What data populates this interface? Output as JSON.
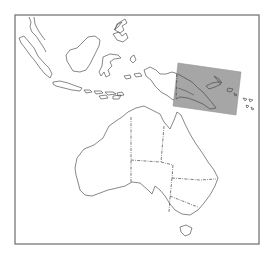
{
  "figure": {
    "type": "locator-map",
    "region": "Australia, Indonesia and Melanesia",
    "frame": {
      "x": 15,
      "y": 15,
      "width": 244,
      "height": 229,
      "stroke": "#777777"
    },
    "highlight": {
      "label": "",
      "area": "Papua New Guinea / Solomon Islands",
      "fill": "#9a9a9a",
      "opacity": 0.9,
      "corners": [
        [
          178,
          63
        ],
        [
          241,
          72
        ],
        [
          236,
          115
        ],
        [
          173,
          106
        ]
      ]
    },
    "colors": {
      "background": "#ffffff",
      "coastline": "#555555",
      "state_border": "#444444"
    },
    "features": [
      "sumatra",
      "java",
      "lesser-sunda-islands",
      "borneo",
      "sulawesi",
      "maluku",
      "philippines-south",
      "new-guinea",
      "new-britain",
      "solomon-islands",
      "vanuatu",
      "australia-mainland",
      "tasmania"
    ],
    "internal_borders": [
      "wa-nt",
      "nt-sa",
      "nt-qld",
      "sa-qld",
      "sa-nsw",
      "qld-nsw",
      "nsw-vic",
      "png-indonesia"
    ]
  }
}
